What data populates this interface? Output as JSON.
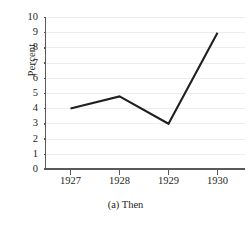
{
  "chart_data": {
    "type": "line",
    "title": "",
    "caption": "(a) Then",
    "xlabel": "",
    "ylabel": "Percent",
    "categories": [
      "1927",
      "1928",
      "1929",
      "1930"
    ],
    "values": [
      4,
      4.8,
      3,
      9
    ],
    "series": [
      {
        "name": "Percent",
        "values": [
          4,
          4.8,
          3,
          9
        ]
      }
    ],
    "ylim": [
      0,
      10
    ],
    "ytick_labels": [
      "0",
      "1",
      "2",
      "3",
      "4",
      "5",
      "6",
      "7",
      "8",
      "9",
      "10"
    ],
    "ytick_values": [
      0,
      1,
      2,
      3,
      4,
      5,
      6,
      7,
      8,
      9,
      10
    ],
    "grid": "horizontal",
    "legend": "none",
    "markers": "none",
    "colors": {
      "line": "#231f20",
      "gridline": "#ededed",
      "axis": "#58595b",
      "text": "#231f20",
      "background": "#ffffff"
    }
  }
}
